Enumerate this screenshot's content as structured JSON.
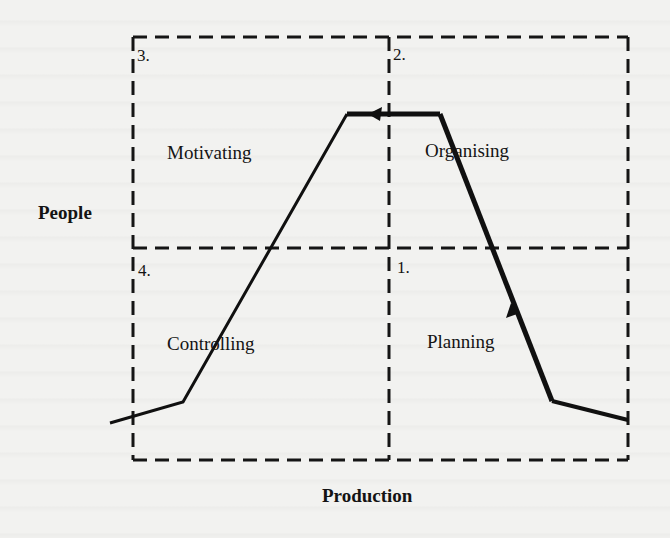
{
  "diagram": {
    "axes": {
      "vertical_label": "People",
      "horizontal_label": "Production"
    },
    "quadrants": [
      {
        "number": "1.",
        "label": "Planning",
        "position": "bottom-right"
      },
      {
        "number": "2.",
        "label": "Organising",
        "position": "top-right"
      },
      {
        "number": "3.",
        "label": "Motivating",
        "position": "top-left"
      },
      {
        "number": "4.",
        "label": "Controlling",
        "position": "bottom-left"
      }
    ],
    "box": {
      "left": 133,
      "top": 37,
      "right": 628,
      "bottom": 460,
      "divider_x": 389,
      "divider_y": 248,
      "line_style": "dashed"
    },
    "cycle_path": {
      "points": [
        [
          110,
          423
        ],
        [
          183,
          402
        ],
        [
          347,
          114
        ],
        [
          440,
          114
        ],
        [
          552,
          401
        ],
        [
          628,
          420
        ]
      ],
      "arrows": [
        {
          "at": [
            375,
            114
          ],
          "direction": "left"
        },
        {
          "at": [
            514,
            312
          ],
          "direction": "up"
        }
      ],
      "sequence": [
        "Planning",
        "Organising",
        "Motivating",
        "Controlling"
      ]
    },
    "colors": {
      "background": "#f2f2f0",
      "ink": "#111111"
    }
  }
}
